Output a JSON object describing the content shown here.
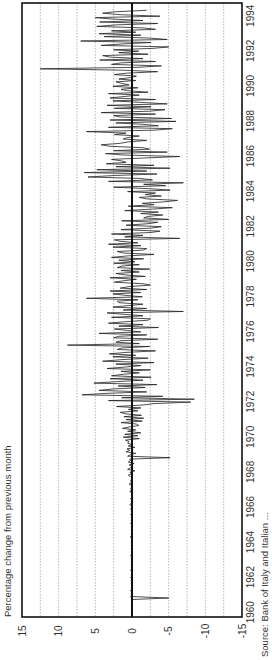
{
  "chart_data": {
    "type": "line",
    "orientation": "rotated-90-ccw",
    "title": "",
    "ylabel": "Percentage change from previous month",
    "xlabel": "",
    "source": "Source: Bank of Italy and Italian ...",
    "ylim": [
      -15,
      15
    ],
    "yticks": [
      15,
      10,
      5,
      0,
      -5,
      -10,
      -15
    ],
    "xlim": [
      1960,
      1995
    ],
    "xticks": [
      1960,
      1962,
      1964,
      1966,
      1968,
      1970,
      1972,
      1974,
      1976,
      1978,
      1980,
      1982,
      1984,
      1986,
      1988,
      1990,
      1992,
      1994
    ],
    "grid": {
      "y_minor_step": 2.5,
      "style": "dotted"
    },
    "zero_line": true,
    "series": [
      {
        "name": "Monthly % change",
        "frequency": "monthly",
        "start": 1960.0,
        "step": 0.0833,
        "values": [
          0.1,
          0,
          0.1,
          0,
          0,
          0.1,
          0,
          0,
          0.1,
          0,
          0,
          0.1,
          0,
          -5.0,
          0.2,
          0,
          0.1,
          0,
          0.2,
          0,
          0.1,
          0,
          0,
          0.1,
          0,
          0.1,
          0,
          0.2,
          0,
          0.1,
          0,
          0,
          0.2,
          0,
          0.1,
          0,
          0.1,
          0,
          0.1,
          0,
          0.1,
          0,
          0.2,
          0,
          0,
          0.1,
          0,
          0.1,
          0,
          0.1,
          0,
          0.1,
          0,
          0,
          0.1,
          0.2,
          0,
          0.1,
          0,
          0,
          0.1,
          0,
          0.1,
          0,
          0.2,
          0,
          0.1,
          0,
          0.1,
          0,
          0.2,
          0,
          0.1,
          0,
          0.2,
          0,
          0.1,
          0.3,
          0,
          0.1,
          0,
          0.2,
          0,
          0.1,
          0,
          0.1,
          0.3,
          0,
          0.2,
          0,
          0.1,
          0.4,
          0,
          0.2,
          0.1,
          0,
          0.2,
          0.5,
          0,
          0.3,
          -0.4,
          0.6,
          0.2,
          0,
          0.4,
          -0.3,
          0.5,
          0.2,
          0.3,
          -5.2,
          0.6,
          0.2,
          -0.5,
          0.8,
          0.3,
          0.7,
          -0.4,
          0.5,
          0.1,
          0.6,
          0.4,
          0.9,
          -1.0,
          1.2,
          -0.8,
          1.0,
          -1.2,
          0.6,
          -0.5,
          1.3,
          0.4,
          -0.9,
          -0.6,
          1.5,
          -1.4,
          0.8,
          -1.6,
          1.1,
          -1.3,
          0.9,
          1.6,
          -0.8,
          0.5,
          -1.2,
          2.1,
          -1.5,
          -3.0,
          -8.0,
          3.2,
          -8.5,
          1.4,
          -4.2,
          6.8,
          3.3,
          -2.0,
          4.5,
          2.5,
          -1.8,
          1.9,
          -3.4,
          5.2,
          2.0,
          -1.5,
          3.0,
          -2.6,
          2.8,
          1.2,
          -1.0,
          1.5,
          -2.5,
          3.4,
          0.8,
          -1.2,
          2.2,
          -3.0,
          4.0,
          1.5,
          -2.2,
          2.6,
          -0.5,
          3.1,
          0.8,
          -3.2,
          2.0,
          1.4,
          -2.4,
          8.8,
          -1.0,
          2.2,
          1.5,
          -3.5,
          2.5,
          1.8,
          -2.0,
          4.5,
          -1.2,
          0.6,
          2.4,
          -3.6,
          1.8,
          -1.5,
          3.2,
          0.9,
          -2.2,
          -2.5,
          2.8,
          -1.5,
          1.0,
          3.4,
          -7.0,
          1.2,
          -2.0,
          2.6,
          0.5,
          -1.5,
          1.8,
          2.0,
          -0.8,
          6.2,
          -1.4,
          0.8,
          2.6,
          -1.2,
          3.0,
          -2.0,
          1.6,
          0.4,
          -2.5,
          -1.5,
          2.4,
          1.2,
          -0.6,
          3.0,
          -1.8,
          0.9,
          2.2,
          -1.0,
          1.5,
          -2.4,
          2.0,
          1.4,
          -1.0,
          2.5,
          -0.4,
          1.8,
          -1.6,
          2.8,
          0.6,
          -3.0,
          1.2,
          2.0,
          -1.5,
          -2.0,
          2.6,
          -1.2,
          3.2,
          -0.8,
          1.6,
          2.4,
          -6.5,
          1.0,
          -1.5,
          2.8,
          -2.6,
          -3.8,
          1.5,
          -2.6,
          -4.0,
          0.8,
          -2.2,
          -3.5,
          1.4,
          -5.0,
          -1.6,
          -2.2,
          -4.2,
          -1.2,
          -3.6,
          1.0,
          -2.8,
          -5.5,
          0.5,
          -3.0,
          -1.4,
          -4.4,
          -6.2,
          -2.0,
          -1.0,
          -4.0,
          -1.8,
          -3.2,
          0.6,
          -5.2,
          -2.4,
          2.5,
          -4.6,
          -1.6,
          -7.0,
          3.2,
          -2.8,
          -1.0,
          6.0,
          2.4,
          -3.4,
          6.5,
          -2.0,
          4.8,
          -5.2,
          2.2,
          -3.0,
          3.5,
          0.8,
          1.4,
          2.8,
          -1.6,
          -6.5,
          1.2,
          3.6,
          -4.8,
          2.5,
          -2.4,
          -1.5,
          3.0,
          4.2,
          1.6,
          0.5,
          -2.0,
          1.2,
          0.6,
          -1.0,
          2.4,
          0.8,
          6.2,
          -3.0,
          -5.5,
          3.2,
          -3.6,
          -1.5,
          2.2,
          -6.0,
          3.0,
          -5.4,
          1.6,
          2.5,
          -3.2,
          4.2,
          -2.4,
          -4.5,
          2.4,
          -2.6,
          3.4,
          -4.8,
          -1.2,
          2.6,
          -3.2,
          3.0,
          1.2,
          -1.0,
          3.2,
          -2.2,
          0.6,
          1.5,
          -0.8,
          2.6,
          0.4,
          1.4,
          2.2,
          -0.5,
          1.8,
          0.2,
          -0.6,
          2.4,
          0.8,
          -3.5,
          1.2,
          12.5,
          -0.8,
          -4.0,
          2.8,
          1.5,
          -3.2,
          4.4,
          -1.5,
          3.0,
          4.0,
          -2.2,
          1.8,
          -0.9,
          2.5,
          -3.0,
          -5.0,
          4.2,
          1.2,
          -2.6,
          7.0,
          -4.8,
          -2.4,
          3.8,
          -1.2,
          4.5,
          -0.5,
          2.8,
          -3.2,
          -1.5,
          4.8,
          2.2,
          -3.5,
          4.4,
          -1.5,
          2.6,
          5.0,
          -3.8,
          1.6,
          4.0,
          2.4,
          -2.0
        ]
      }
    ]
  },
  "layout": {
    "frame": {
      "left": 22,
      "top": 3,
      "right": 242,
      "bottom": 617
    },
    "colors": {
      "line": "#222222",
      "frame": "#111111",
      "grid": "#999999",
      "zero": "#111111"
    }
  }
}
